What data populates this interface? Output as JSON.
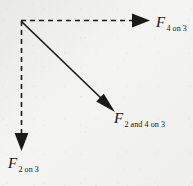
{
  "figure": {
    "background_color": "#efefec",
    "stroke_color": "#1a1a1a",
    "origin": {
      "x": 21,
      "y": 21
    },
    "labels": [
      {
        "id": "f4on3",
        "symbol": "F",
        "subscript": "4 on 3",
        "x": 156,
        "y": 14
      },
      {
        "id": "f2and4on3",
        "symbol": "F",
        "subscript": "2 and 4 on 3",
        "x": 114,
        "y": 110
      },
      {
        "id": "f2on3",
        "symbol": "F",
        "subscript": "2 on 3",
        "x": 8,
        "y": 155
      }
    ],
    "vectors": [
      {
        "id": "horizontal-dashed-arrow",
        "name": "F 4 on 3",
        "style": "dashed",
        "from": {
          "x": 21,
          "y": 21
        },
        "to": {
          "x": 150,
          "y": 21
        },
        "direction": "right",
        "dash_pattern": "5 4",
        "stroke_width": 1.6,
        "arrowhead": {
          "length": 17,
          "half_width": 7
        }
      },
      {
        "id": "vertical-dashed-arrow",
        "name": "F 2 on 3",
        "style": "dashed",
        "from": {
          "x": 21,
          "y": 21
        },
        "to": {
          "x": 21,
          "y": 151
        },
        "direction": "down",
        "dash_pattern": "5 4",
        "stroke_width": 1.6,
        "arrowhead": {
          "length": 17,
          "half_width": 7
        }
      },
      {
        "id": "resultant-solid-arrow",
        "name": "F 2 and 4 on 3",
        "style": "solid",
        "from": {
          "x": 21,
          "y": 21
        },
        "to": {
          "x": 115,
          "y": 112
        },
        "direction": "down-right",
        "angle_deg": 44,
        "stroke_width": 1.7,
        "arrowhead": {
          "length": 18,
          "half_width": 7
        }
      }
    ]
  }
}
